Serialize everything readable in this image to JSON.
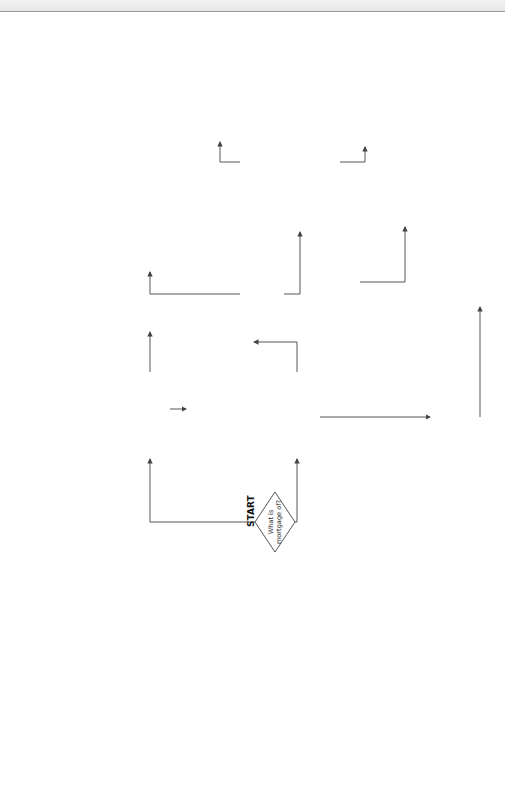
{
  "start_label": "START",
  "caption": {
    "figure": "Figure 23.4",
    "text": "Priorities of mortgages in registered and unregistered land"
  },
  "decisions": {
    "mortgage_of": [
      "What is",
      "mortgage of?"
    ],
    "registered_or_unregistered": [
      "Registered or",
      "unregistered?"
    ],
    "interest_under_trust": [
      "Does the interest",
      "arise under a",
      "trust?"
    ],
    "later_disposition_for_value": [
      "Is the later",
      "disposition",
      "for value?"
    ],
    "earlier_disposition": [
      "Is the earlier disposition—",
      "(1) a registered charge",
      "(2) protected by notice",
      "or",
      "(3) listed in Sch. 3, LRA",
      "2002 (overriding)?"
    ],
    "holds_title_deeds": [
      "Does the",
      "mortgagee hold the",
      "title deeds?"
    ],
    "mortgage_legal_or_equitable_unreg": [
      "Mortgage",
      "legal or equitable?"
    ],
    "mortgage_legal_or_equitable_deeds": [
      "Is the",
      "mortgage legal",
      "or equitable?"
    ],
    "late_competing_interest": [
      "Is the late",
      "competing interest",
      "legal or equitable?"
    ]
  },
  "outcomes": {
    "dearle_v_hall": [
      "Dearle v Hall"
    ],
    "equities_equal": [
      "Where the equities are",
      "equal the first in time",
      "prevails"
    ],
    "earlier_retains_1": [
      "Earlier interest",
      "retains priority"
    ],
    "earlier_retains_2": [
      "Earlier interest",
      "retains priority"
    ],
    "earlier_loses": [
      "Earlier interest loses its priority",
      "to the later interest—s. 29 LRA",
      "2002"
    ],
    "class_c_iii": [
      "Priority depends on",
      "registration as a class",
      "C(iii) land charge"
    ],
    "class_c_i": [
      "Priority depends on",
      "registration as a class",
      "C(i) land charge"
    ],
    "good_against_world": [
      "Takes priority over all",
      "later interests—'Good",
      "against the world'",
      "unless priority lost due",
      "to fraud etc."
    ],
    "later_legal_interest": [
      "Later legal interest",
      "obtains priority unless",
      "mortgagee knew of earlier",
      "interest or was 'negligent'",
      "in making enquiries"
    ],
    "decided_by_rule": [
      "Priority decided by rule:",
      "Where the equities",
      "are equal the first",
      "in time prevails"
    ]
  },
  "edge_labels": {
    "equitable_interest": [
      "Equitable",
      "interest"
    ],
    "legal_estate": "Legal    estate",
    "yes": "Yes",
    "no": "No",
    "registered": "Registered",
    "unregistered": "Unregistered",
    "equitable": "Equitable",
    "legal": "Legal"
  }
}
